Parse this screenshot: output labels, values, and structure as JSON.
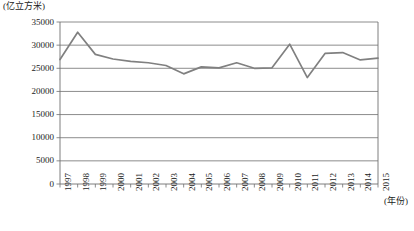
{
  "chart_data": {
    "type": "line",
    "title": "",
    "subtitle": "",
    "unit_label": "(亿立方米)",
    "xlabel": "(年份)",
    "ylabel": "",
    "categories": [
      "1997",
      "1998",
      "1999",
      "2000",
      "2001",
      "2002",
      "2003",
      "2004",
      "2005",
      "2006",
      "2007",
      "2008",
      "2009",
      "2010",
      "2011",
      "2012",
      "2013",
      "2014",
      "2015"
    ],
    "values": [
      26900,
      32800,
      28000,
      27000,
      26500,
      26200,
      25600,
      23800,
      25300,
      25100,
      26200,
      25000,
      25100,
      30200,
      23000,
      28200,
      28400,
      26800,
      27200
    ],
    "series": [
      {
        "name": "年径流量",
        "values": [
          26900,
          32800,
          28000,
          27000,
          26500,
          26200,
          25600,
          23800,
          25300,
          25100,
          26200,
          25000,
          25100,
          30200,
          23000,
          28200,
          28400,
          26800,
          27200
        ]
      }
    ],
    "ylim": [
      0,
      35000
    ],
    "yticks": [
      0,
      5000,
      10000,
      15000,
      20000,
      25000,
      30000,
      35000
    ],
    "ytick_labels": [
      "0",
      "5000",
      "10000",
      "15000",
      "20000",
      "25000",
      "30000",
      "35000"
    ],
    "grid": true,
    "grid_axis": "y",
    "legend": false,
    "legend_position": "none",
    "line_color": "#808080",
    "grid_color": "#6f6f6f",
    "axis_color": "#6f6f6f",
    "background": "#ffffff"
  },
  "caption": {
    "text": ""
  }
}
